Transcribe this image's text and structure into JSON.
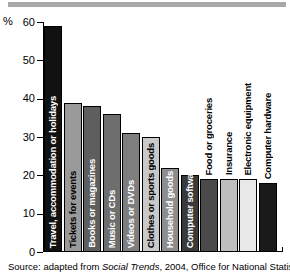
{
  "axis_unit_label": "%",
  "source_note": {
    "prefix": "Source: adapted from ",
    "italic": "Social Trends",
    "suffix": ", 2004, Office for National Statistics."
  },
  "chart_data": {
    "type": "bar",
    "title": "",
    "xlabel": "",
    "ylabel": "%",
    "ylim": [
      0,
      60
    ],
    "yticks": [
      0,
      10,
      20,
      30,
      40,
      50,
      60
    ],
    "grid": false,
    "legend": "none",
    "categories": [
      "Travel, accommodation or holidays",
      "Tickets for events",
      "Books or magazines",
      "Music or CDs",
      "Videos or DVDs",
      "Clothes or sports goods",
      "Household goods",
      "Computer software",
      "Food or groceries",
      "Insurance",
      "Electronic equipment",
      "Computer hardware"
    ],
    "values": [
      59,
      39,
      38,
      36,
      31,
      30,
      22,
      20,
      19,
      19,
      19,
      18
    ],
    "bar_colors": [
      "#111111",
      "#9a9a9a",
      "#5e5e5e",
      "#6e6e6e",
      "#7e7e7e",
      "#c9c9c9",
      "#8d8d8d",
      "#3a3a3a",
      "#4a4a4a",
      "#bdbdbd",
      "#e8e8e8",
      "#1a1a1a"
    ],
    "label_placement": [
      "inside",
      "inside",
      "inside",
      "inside",
      "inside",
      "inside",
      "inside",
      "inside",
      "outside",
      "outside",
      "outside",
      "outside"
    ]
  }
}
